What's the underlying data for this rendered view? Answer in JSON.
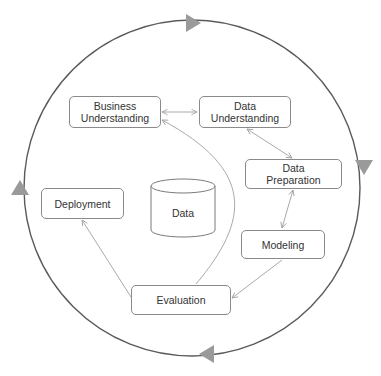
{
  "diagram": {
    "phases": [
      {
        "id": "business_understanding",
        "label": "Business\nUnderstanding"
      },
      {
        "id": "data_understanding",
        "label": "Data\nUnderstanding"
      },
      {
        "id": "data_preparation",
        "label": "Data\nPreparation"
      },
      {
        "id": "modeling",
        "label": "Modeling"
      },
      {
        "id": "evaluation",
        "label": "Evaluation"
      },
      {
        "id": "deployment",
        "label": "Deployment"
      }
    ],
    "center": {
      "label": "Data"
    },
    "edges": [
      {
        "from": "business_understanding",
        "to": "data_understanding",
        "bidirectional": true
      },
      {
        "from": "data_understanding",
        "to": "data_preparation",
        "bidirectional": true
      },
      {
        "from": "data_preparation",
        "to": "modeling",
        "bidirectional": true
      },
      {
        "from": "modeling",
        "to": "evaluation",
        "bidirectional": false
      },
      {
        "from": "evaluation",
        "to": "business_understanding",
        "bidirectional": false
      },
      {
        "from": "evaluation",
        "to": "deployment",
        "bidirectional": false
      }
    ],
    "outer_cycle": {
      "direction": "clockwise",
      "arrowheads": 4
    },
    "colors": {
      "outer_circle": "#555555",
      "arrowheads": "#9a9a9a",
      "inner_arrows": "#aaaaaa",
      "box_border": "#8a8a8a",
      "text": "#333333"
    }
  }
}
